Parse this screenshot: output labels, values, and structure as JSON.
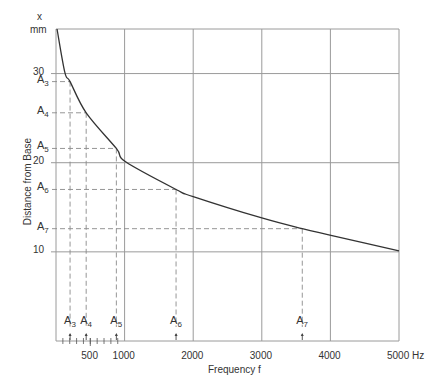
{
  "chart_data": {
    "type": "line",
    "title": "",
    "xlabel": "Frequency f",
    "ylabel": "Distance from Base",
    "x_unit": "Hz",
    "y_unit_top": "x",
    "y_unit": "mm",
    "xlim": [
      0,
      5000
    ],
    "ylim": [
      0,
      35
    ],
    "grid": true,
    "x_ticks": [
      {
        "value": 500,
        "label": "500"
      },
      {
        "value": 1000,
        "label": "1000"
      },
      {
        "value": 2000,
        "label": "2000"
      },
      {
        "value": 3000,
        "label": "3000"
      },
      {
        "value": 4000,
        "label": "4000"
      },
      {
        "value": 5000,
        "label": "5000 Hz"
      }
    ],
    "y_ticks": [
      {
        "value": 10,
        "label": "10"
      },
      {
        "value": 20,
        "label": "20"
      },
      {
        "value": 30,
        "label": "30"
      }
    ],
    "series": [
      {
        "name": "Distance from Base vs Frequency",
        "x": [
          15,
          130,
          205,
          440,
          880,
          1015,
          1750,
          2000,
          3000,
          3590,
          4040,
          5000
        ],
        "y": [
          35.0,
          30.1,
          29.1,
          25.6,
          21.6,
          20.1,
          17.0,
          16.2,
          13.8,
          12.6,
          11.8,
          10.1
        ]
      }
    ],
    "annotations": [
      {
        "name": "A",
        "sub": "3",
        "x": 205,
        "y": 29.1
      },
      {
        "name": "A",
        "sub": "4",
        "x": 440,
        "y": 25.6
      },
      {
        "name": "A",
        "sub": "5",
        "x": 880,
        "y": 21.6
      },
      {
        "name": "A",
        "sub": "6",
        "x": 1750,
        "y": 17.0
      },
      {
        "name": "A",
        "sub": "7",
        "x": 3590,
        "y": 12.6
      }
    ]
  },
  "style": {
    "line_color": "#333333",
    "grid_color": "#9a9a9a",
    "dash_color": "#8a8a8a"
  }
}
